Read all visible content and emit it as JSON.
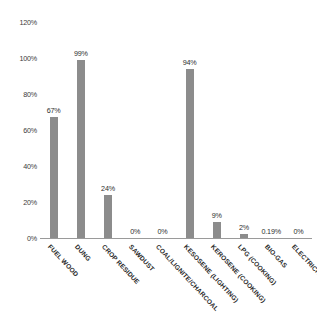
{
  "chart_data": {
    "type": "bar",
    "title": "",
    "subtitle": "",
    "xlabel": "",
    "ylabel": "",
    "ylim": [
      0,
      120
    ],
    "ytick_step": 20,
    "ytick_labels": [
      "0%",
      "20%",
      "40%",
      "60%",
      "80%",
      "100%",
      "120%"
    ],
    "ytick_values": [
      0,
      20,
      40,
      60,
      80,
      100,
      120
    ],
    "grid": false,
    "legend": false,
    "legend_position": "none",
    "bar_color": "#8c8c8c",
    "axis_color": "#9a9a9a",
    "text_color": "#2e2e2e",
    "categories": [
      "FUEL WOOD",
      "DUNG",
      "CROP RESIDUE",
      "SAWDUST",
      "COAL/LIGNITE/CHARCOAL",
      "KESOSENE (LIGHTING)",
      "KEROSENE (COOKING)",
      "LPG (COOKING)",
      "BIO-GAS",
      "ELECTRICITY"
    ],
    "values": [
      67,
      99,
      24,
      0,
      0,
      94,
      9,
      2,
      0.19,
      0
    ],
    "value_labels": [
      "67%",
      "99%",
      "24%",
      "0%",
      "0%",
      "94%",
      "9%",
      "2%",
      "0.19%",
      "0%"
    ]
  }
}
